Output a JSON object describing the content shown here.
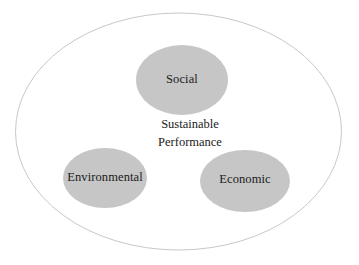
{
  "diagram": {
    "type": "venn-three-circle",
    "background_color": "#ffffff",
    "outer_boundary": {
      "name": "outer-ellipse",
      "stroke_color": "#c8c8c8",
      "fill": "none",
      "stroke_width": 1
    },
    "node_fill_color": "#c6c6c6",
    "label_color": "#1a1a1a",
    "center_label": {
      "line1": "Sustainable",
      "line2": "Performance"
    },
    "nodes": [
      {
        "id": "social",
        "label": "Social",
        "position": "top-center",
        "cx": 182,
        "cy": 80,
        "rx": 46,
        "ry": 35,
        "fill": "#c6c6c6"
      },
      {
        "id": "environmental",
        "label": "Environmental",
        "position": "bottom-left",
        "cx": 105,
        "cy": 178,
        "rx": 42,
        "ry": 30,
        "fill": "#c6c6c6"
      },
      {
        "id": "economic",
        "label": "Economic",
        "position": "bottom-right",
        "cx": 245,
        "cy": 181,
        "rx": 45,
        "ry": 31,
        "fill": "#c6c6c6"
      }
    ]
  }
}
